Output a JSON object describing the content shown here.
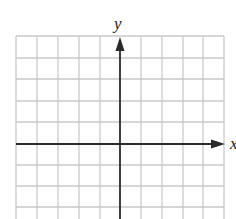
{
  "diagram": {
    "type": "coordinate-grid",
    "x_axis_label": "x",
    "y_axis_label": "y",
    "grid": {
      "columns": 10,
      "visible_rows": 8.5,
      "cell_size_px": 20.8,
      "grid_color": "#c8c8c8",
      "axis_color": "#2a2a2a"
    }
  }
}
